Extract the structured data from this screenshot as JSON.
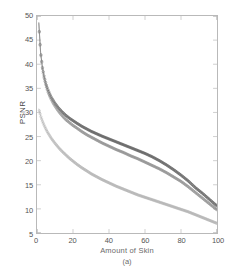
{
  "chart_data": {
    "type": "line",
    "title": "",
    "subcaption": "(a)",
    "xlabel": "Amount of Skin",
    "ylabel": "PSNR",
    "xlim": [
      0,
      100
    ],
    "ylim": [
      5,
      50
    ],
    "xticks": [
      0,
      20,
      40,
      60,
      80,
      100
    ],
    "yticks": [
      5,
      10,
      15,
      20,
      25,
      30,
      35,
      40,
      45,
      50
    ],
    "grid": false,
    "legend": "none",
    "marker": "circle",
    "x": [
      1,
      2,
      3,
      4,
      5,
      6,
      7,
      8,
      9,
      10,
      12,
      14,
      16,
      18,
      20,
      22,
      25,
      28,
      30,
      33,
      36,
      40,
      44,
      48,
      52,
      56,
      60,
      64,
      68,
      72,
      76,
      80,
      84,
      88,
      92,
      96,
      100
    ],
    "series": [
      {
        "name": "curve-1",
        "color": "#5a5a5a",
        "values": [
          48.7,
          42.5,
          39.4,
          37.4,
          35.9,
          34.8,
          33.9,
          33.1,
          32.5,
          31.9,
          30.9,
          30.1,
          29.4,
          28.8,
          28.3,
          27.8,
          27.1,
          26.5,
          26.1,
          25.6,
          25.1,
          24.5,
          23.9,
          23.3,
          22.7,
          22.1,
          21.5,
          20.8,
          20.0,
          19.1,
          18.1,
          17.0,
          15.8,
          14.4,
          13.2,
          11.9,
          10.6
        ]
      },
      {
        "name": "curve-2",
        "color": "#8a8a8a",
        "values": [
          48.5,
          42.3,
          39.1,
          37.0,
          35.5,
          34.3,
          33.4,
          32.6,
          31.9,
          31.3,
          30.2,
          29.3,
          28.5,
          27.9,
          27.3,
          26.8,
          26.0,
          25.3,
          24.9,
          24.3,
          23.7,
          23.0,
          22.3,
          21.7,
          21.0,
          20.4,
          19.7,
          19.0,
          18.3,
          17.5,
          16.6,
          15.7,
          14.6,
          13.4,
          12.2,
          11.0,
          9.8
        ]
      },
      {
        "name": "curve-3",
        "color": "#b0b0b0",
        "values": [
          30.8,
          29.3,
          28.2,
          27.3,
          26.5,
          25.8,
          25.2,
          24.6,
          24.1,
          23.6,
          22.7,
          21.9,
          21.2,
          20.5,
          19.9,
          19.3,
          18.5,
          17.8,
          17.3,
          16.7,
          16.1,
          15.4,
          14.7,
          14.1,
          13.5,
          12.9,
          12.4,
          11.9,
          11.4,
          10.9,
          10.4,
          9.9,
          9.4,
          8.8,
          8.2,
          7.6,
          7.0
        ]
      }
    ]
  },
  "axis": {
    "y_tick_labels": [
      "50",
      "45",
      "40",
      "35",
      "30",
      "25",
      "20",
      "15",
      "10",
      "5"
    ],
    "x_tick_labels": [
      "0",
      "20",
      "40",
      "60",
      "80",
      "100"
    ]
  },
  "colors": {
    "frame": "#b9b9b9",
    "tick_text": "#555555",
    "label_text": "#4a4a4a"
  }
}
